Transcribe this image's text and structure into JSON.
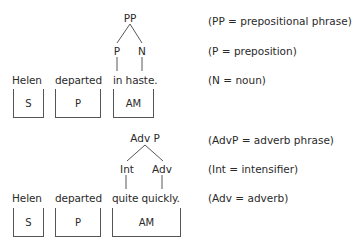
{
  "diagram1": {
    "tree": {
      "root": "PP",
      "left": "P",
      "right": "N"
    },
    "words": {
      "subject": "Helen",
      "verb": "departed",
      "adverbial": "in haste."
    },
    "boxes": {
      "subject": "S",
      "verb": "P",
      "adverbial": "AM"
    },
    "annotations": [
      "(PP = prepositional phrase)",
      "(P = preposition)",
      "(N = noun)"
    ]
  },
  "diagram2": {
    "tree": {
      "root": "Adv P",
      "left": "Int",
      "right": "Adv"
    },
    "words": {
      "subject": "Helen",
      "verb": "departed",
      "adverbial": "quite quickly."
    },
    "boxes": {
      "subject": "S",
      "verb": "P",
      "adverbial": "AM"
    },
    "annotations": [
      "(AdvP = adverb phrase)",
      "(Int = intensifier)",
      "(Adv = adverb)"
    ]
  }
}
